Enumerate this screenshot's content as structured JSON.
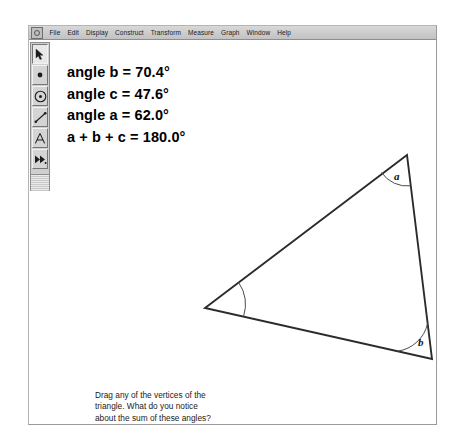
{
  "window": {
    "app_icon": "app-menu-icon",
    "menu_items": [
      {
        "label": "File",
        "mnemonic": "F"
      },
      {
        "label": "Edit",
        "mnemonic": "E"
      },
      {
        "label": "Display",
        "mnemonic": "D"
      },
      {
        "label": "Construct",
        "mnemonic": "C"
      },
      {
        "label": "Transform",
        "mnemonic": "T"
      },
      {
        "label": "Measure",
        "mnemonic": "M"
      },
      {
        "label": "Graph",
        "mnemonic": "G"
      },
      {
        "label": "Window",
        "mnemonic": "W"
      },
      {
        "label": "Help",
        "mnemonic": "H"
      }
    ]
  },
  "toolbar": {
    "tools": [
      {
        "name": "selection-arrow-tool",
        "icon": "arrow-icon",
        "selected": true
      },
      {
        "name": "point-tool",
        "icon": "point-icon",
        "selected": false
      },
      {
        "name": "compass-circle-tool",
        "icon": "circle-icon",
        "selected": false
      },
      {
        "name": "straightedge-tool",
        "icon": "segment-icon",
        "selected": false
      },
      {
        "name": "text-tool",
        "icon": "letter-a-icon",
        "selected": false
      },
      {
        "name": "custom-tool",
        "icon": "double-arrow-icon",
        "selected": false
      }
    ]
  },
  "measurements": [
    "angle b = 70.4°",
    "angle c = 47.6°",
    "angle a = 62.0°",
    "a + b + c = 180.0°"
  ],
  "caption": [
    "Drag any of the vertices of the",
    "triangle. What do you notice",
    "about the sum of these angles?"
  ],
  "figure": {
    "type": "triangle",
    "vertices": [
      {
        "id": "A",
        "label": "a",
        "x": 356,
        "y": 113,
        "angle_deg": 62.0,
        "labeled": true
      },
      {
        "id": "B",
        "label": "b",
        "x": 381,
        "y": 317,
        "angle_deg": 70.4,
        "labeled": true
      },
      {
        "id": "C",
        "label": "c",
        "x": 154,
        "y": 266,
        "angle_deg": 47.6,
        "labeled": false
      }
    ],
    "angle_sum_deg": 180.0,
    "labels": [
      {
        "text": "a",
        "x": 343,
        "y": 134
      },
      {
        "text": "b",
        "x": 368,
        "y": 300
      }
    ],
    "colors": {
      "side_stroke": "#2b2b2b",
      "arc_stroke": "#4a4a4a",
      "canvas_bg": "#ffffff"
    }
  }
}
